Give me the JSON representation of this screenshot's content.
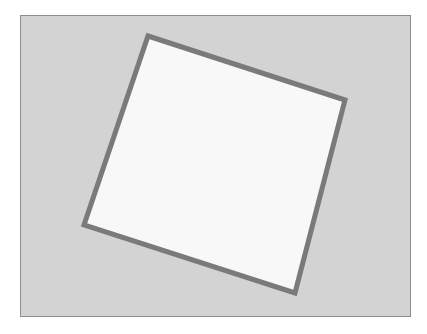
{
  "figure": {
    "frame": {
      "x": 20,
      "y": 15,
      "width": 391,
      "height": 302,
      "fill": "#d3d3d3",
      "stroke": "#8e8e8e"
    },
    "rotated_square": {
      "points": "148,36 345,100 295,293 84,225",
      "fill": "#f8f8f8",
      "stroke": "#7a7a7a",
      "stroke_width": 5
    }
  }
}
